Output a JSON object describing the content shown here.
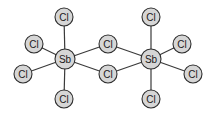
{
  "diagram": {
    "type": "molecular-structure",
    "colors": {
      "atom_fill": "#d6d6d6",
      "atom_stroke": "#2e2e2e",
      "bond": "#3a3a3a",
      "background": "#ffffff"
    },
    "atoms": [
      {
        "id": "sb1",
        "label": "Sb",
        "x": 65,
        "y": 59,
        "r": 10
      },
      {
        "id": "sb2",
        "label": "Sb",
        "x": 151,
        "y": 59,
        "r": 10
      },
      {
        "id": "cl1",
        "label": "Cl",
        "x": 64,
        "y": 17,
        "r": 9
      },
      {
        "id": "cl2",
        "label": "Cl",
        "x": 34,
        "y": 44,
        "r": 9
      },
      {
        "id": "cl3",
        "label": "Cl",
        "x": 23,
        "y": 74,
        "r": 9
      },
      {
        "id": "cl4",
        "label": "Cl",
        "x": 64,
        "y": 99,
        "r": 9
      },
      {
        "id": "cl5",
        "label": "Cl",
        "x": 108,
        "y": 44,
        "r": 9
      },
      {
        "id": "cl6",
        "label": "Cl",
        "x": 108,
        "y": 74,
        "r": 9
      },
      {
        "id": "cl7",
        "label": "Cl",
        "x": 151,
        "y": 17,
        "r": 9
      },
      {
        "id": "cl8",
        "label": "Cl",
        "x": 182,
        "y": 44,
        "r": 9
      },
      {
        "id": "cl9",
        "label": "Cl",
        "x": 193,
        "y": 74,
        "r": 9
      },
      {
        "id": "cl10",
        "label": "Cl",
        "x": 151,
        "y": 99,
        "r": 9
      }
    ],
    "bonds": [
      [
        "sb1",
        "cl1"
      ],
      [
        "sb1",
        "cl2"
      ],
      [
        "sb1",
        "cl3"
      ],
      [
        "sb1",
        "cl4"
      ],
      [
        "sb1",
        "cl5"
      ],
      [
        "sb1",
        "cl6"
      ],
      [
        "sb2",
        "cl5"
      ],
      [
        "sb2",
        "cl6"
      ],
      [
        "sb2",
        "cl7"
      ],
      [
        "sb2",
        "cl8"
      ],
      [
        "sb2",
        "cl9"
      ],
      [
        "sb2",
        "cl10"
      ]
    ]
  }
}
